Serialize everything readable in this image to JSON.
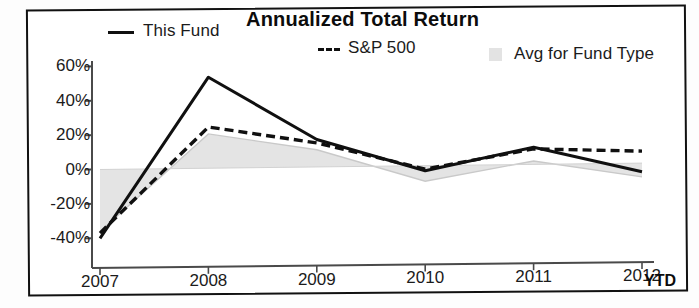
{
  "chart_data": {
    "type": "line",
    "title": "Annualized Total Return",
    "xlabel": "",
    "ylabel": "",
    "x": [
      "2007",
      "2008",
      "2009",
      "2010",
      "2011",
      "2012"
    ],
    "categories": [
      "2007",
      "2008",
      "2009",
      "2010",
      "2011",
      "2012"
    ],
    "x_axis_suffix": "YTD",
    "ytick_labels": [
      "60%",
      "40%",
      "20%",
      "0%",
      "-20%",
      "-40%"
    ],
    "ytick_values": [
      60,
      40,
      20,
      0,
      -20,
      -40
    ],
    "ylim": [
      -48,
      62
    ],
    "grid": false,
    "legend_position": "top",
    "series": [
      {
        "name": "This Fund",
        "style": "solid",
        "color": "#101010",
        "values": [
          -40,
          53,
          16,
          -3,
          10,
          -5
        ]
      },
      {
        "name": "S&P 500",
        "style": "dashed",
        "color": "#101010",
        "values": [
          -37,
          24,
          14,
          -2,
          9,
          7
        ]
      },
      {
        "name": "Avg for Fund Type",
        "style": "area",
        "color": "#e3e3e3",
        "values": [
          -36,
          20,
          10,
          -9,
          2,
          -8
        ]
      }
    ],
    "annotations": []
  },
  "chart": {
    "title": "Annualized Total Return",
    "legend": [
      {
        "label": "This Fund",
        "marker": "solid-line"
      },
      {
        "label": "S&P 500",
        "marker": "dashed-line"
      },
      {
        "label": "Avg for Fund Type",
        "marker": "filled-square"
      }
    ],
    "x_axis": {
      "ticks": [
        "2007",
        "2008",
        "2009",
        "2010",
        "2011",
        "2012"
      ],
      "suffix": "YTD"
    },
    "y_axis": {
      "ticks": [
        "60%",
        "40%",
        "20%",
        "0%",
        "-20%",
        "-40%"
      ]
    }
  },
  "colors": {
    "line": "#101010",
    "area": "#e3e3e3",
    "axis": "#4a4a4a",
    "frame": "#111111",
    "text": "#1b1b1b"
  }
}
